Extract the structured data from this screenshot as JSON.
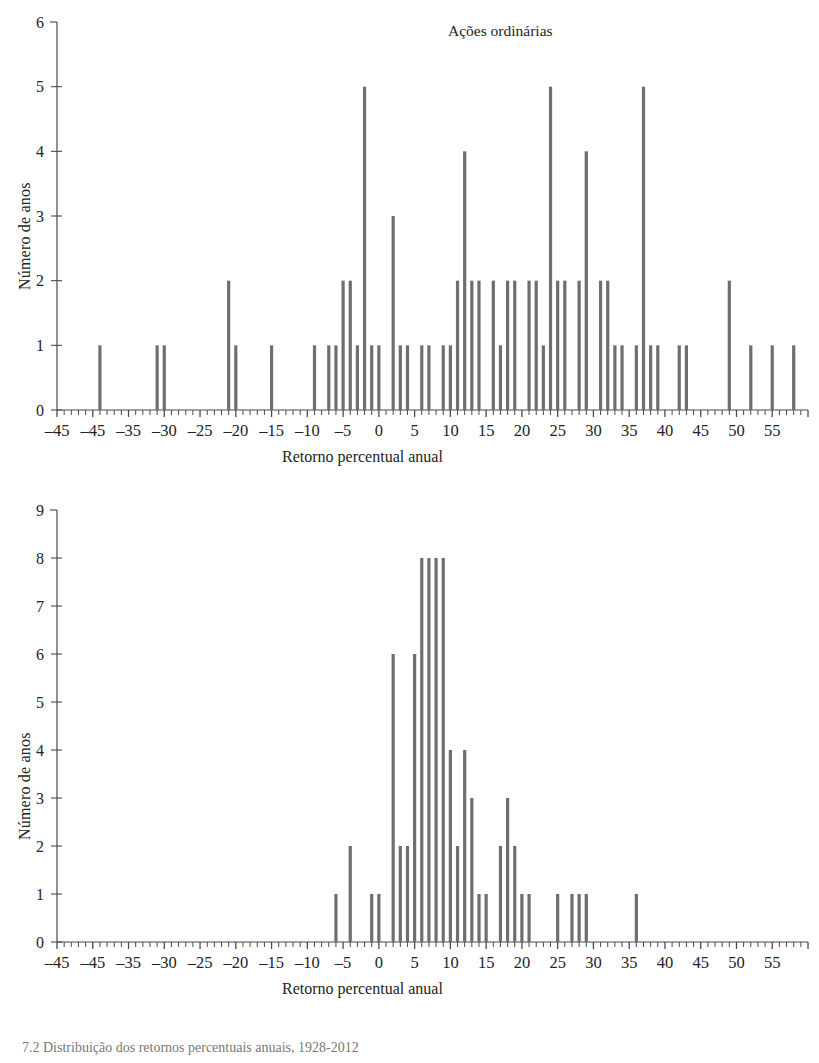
{
  "figure": {
    "caption": "7.2   Distribuição dos retornos percentuais anuais, 1928-2012",
    "axis_color": "#4a4a4a",
    "bar_color": "#6e6e6e"
  },
  "panels": [
    {
      "id": "top",
      "title": "Ações ordinárias",
      "xlabel": "Retorno percentual anual",
      "ylabel": "Número de anos",
      "yticks": [
        "0",
        "1",
        "2",
        "3",
        "4",
        "5",
        "6"
      ],
      "xticklabels": [
        "–45",
        "–45",
        "–35",
        "–30",
        "–25",
        "–20",
        "–15",
        "–10",
        "–5",
        "0",
        "5",
        "10",
        "15",
        "20",
        "25",
        "30",
        "35",
        "40",
        "45",
        "50",
        "55"
      ]
    },
    {
      "id": "bottom",
      "title": "Títulos governamentais a longo prazo",
      "xlabel": "Retorno percentual anual",
      "ylabel": "Número de anos",
      "yticks": [
        "0",
        "1",
        "2",
        "3",
        "4",
        "5",
        "6",
        "7",
        "8",
        "9"
      ],
      "xticklabels": [
        "–45",
        "–45",
        "–35",
        "–30",
        "–25",
        "–20",
        "–15",
        "–10",
        "–5",
        "0",
        "5",
        "10",
        "15",
        "20",
        "25",
        "30",
        "35",
        "40",
        "45",
        "50",
        "55"
      ]
    }
  ],
  "chart_data": [
    {
      "type": "bar",
      "title": "Ações ordinárias",
      "xlabel": "Retorno percentual anual",
      "ylabel": "Número de anos",
      "xlim": [
        -50,
        55
      ],
      "ylim": [
        0,
        6
      ],
      "xtick_step": 5,
      "xminor_step": 1,
      "grid": false,
      "legend": null,
      "xticks": [
        -50,
        -45,
        -40,
        -35,
        -30,
        -25,
        -20,
        -15,
        -10,
        -5,
        0,
        5,
        10,
        15,
        20,
        25,
        30,
        35,
        40,
        45,
        50,
        55
      ],
      "xtick_labels": [
        "–45",
        "–45",
        "–35",
        "–30",
        "–25",
        "–20",
        "–15",
        "–10",
        "–5",
        "0",
        "5",
        "10",
        "15",
        "20",
        "25",
        "30",
        "35",
        "40",
        "45",
        "50",
        "55"
      ],
      "x": [
        -44,
        -36,
        -35,
        -26,
        -25,
        -20,
        -14,
        -12,
        -11,
        -10,
        -9,
        -8,
        -7,
        -6,
        -5,
        -3,
        -2,
        -1,
        1,
        2,
        4,
        5,
        6,
        7,
        8,
        9,
        11,
        12,
        13,
        14,
        16,
        17,
        18,
        19,
        20,
        21,
        23,
        24,
        26,
        27,
        28,
        29,
        31,
        32,
        33,
        34,
        37,
        38,
        44,
        47,
        50,
        53
      ],
      "values": [
        1,
        1,
        1,
        2,
        1,
        1,
        1,
        1,
        1,
        2,
        2,
        1,
        5,
        1,
        1,
        3,
        1,
        1,
        1,
        1,
        1,
        1,
        2,
        4,
        2,
        2,
        2,
        1,
        2,
        2,
        2,
        2,
        1,
        5,
        2,
        2,
        2,
        4,
        2,
        2,
        1,
        1,
        1,
        5,
        1,
        1,
        1,
        1,
        2,
        1,
        1,
        1
      ]
    },
    {
      "type": "bar",
      "title": "Títulos governamentais a longo prazo",
      "xlabel": "Retorno percentual anual",
      "ylabel": "Número de anos",
      "xlim": [
        -50,
        55
      ],
      "ylim": [
        0,
        9
      ],
      "xtick_step": 5,
      "xminor_step": 1,
      "grid": false,
      "legend": null,
      "xticks": [
        -50,
        -45,
        -40,
        -35,
        -30,
        -25,
        -20,
        -15,
        -10,
        -5,
        0,
        5,
        10,
        15,
        20,
        25,
        30,
        35,
        40,
        45,
        50,
        55
      ],
      "xtick_labels": [
        "–45",
        "–45",
        "–35",
        "–30",
        "–25",
        "–20",
        "–15",
        "–10",
        "–5",
        "0",
        "5",
        "10",
        "15",
        "20",
        "25",
        "30",
        "35",
        "40",
        "45",
        "50",
        "55"
      ],
      "x": [
        -11,
        -9,
        -6,
        -5,
        -3,
        -2,
        -1,
        0,
        1,
        2,
        3,
        4,
        5,
        6,
        7,
        8,
        9,
        10,
        12,
        13,
        14,
        15,
        16,
        20,
        22,
        23,
        24,
        31
      ],
      "values": [
        1,
        2,
        1,
        1,
        6,
        2,
        2,
        6,
        8,
        8,
        8,
        8,
        4,
        2,
        4,
        3,
        1,
        1,
        2,
        3,
        2,
        1,
        1,
        1,
        1,
        1,
        1,
        1
      ]
    }
  ]
}
